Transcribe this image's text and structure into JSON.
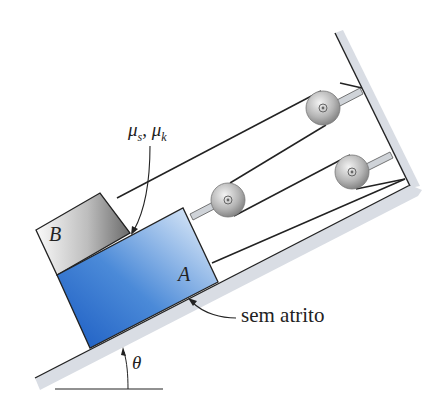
{
  "figure": {
    "type": "physics-diagram"
  },
  "labels": {
    "block_b": "B",
    "block_a": "A",
    "friction_coeffs": "μs, μk",
    "mu_s": "μ",
    "mu_s_sub": "s",
    "mu_k": "μ",
    "mu_k_sub": "k",
    "frictionless": "sem atrito",
    "angle": "θ"
  },
  "colors": {
    "block_a_dark": "#1f5fc4",
    "block_a_light": "#e8f1fb",
    "block_b_dark": "#6e6e6e",
    "block_b_light": "#f2f2f2",
    "incline": "#d9dde4",
    "pulley": "#b8b8b8",
    "line": "#222222"
  },
  "pulleys": [
    {
      "id": "lower-left",
      "cx": 228,
      "cy": 200
    },
    {
      "id": "upper-right",
      "cx": 323,
      "cy": 108
    },
    {
      "id": "lower-right",
      "cx": 352,
      "cy": 172
    }
  ]
}
